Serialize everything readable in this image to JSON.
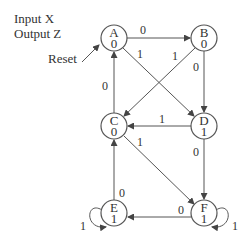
{
  "header": {
    "input": "Input X",
    "output": "Output Z"
  },
  "reset_label": "Reset",
  "states": [
    {
      "name": "A",
      "output": "0",
      "x": 114,
      "y": 38
    },
    {
      "name": "B",
      "output": "0",
      "x": 204,
      "y": 38
    },
    {
      "name": "C",
      "output": "0",
      "x": 114,
      "y": 126
    },
    {
      "name": "D",
      "output": "1",
      "x": 204,
      "y": 126
    },
    {
      "name": "E",
      "output": "1",
      "x": 114,
      "y": 213
    },
    {
      "name": "F",
      "output": "1",
      "x": 204,
      "y": 213
    }
  ],
  "transitions": [
    {
      "from": "A",
      "to": "B",
      "input": "0"
    },
    {
      "from": "A",
      "to": "D",
      "input": "1"
    },
    {
      "from": "B",
      "to": "C",
      "input": "1"
    },
    {
      "from": "B",
      "to": "D",
      "input": "0"
    },
    {
      "from": "C",
      "to": "A",
      "input": "0"
    },
    {
      "from": "C",
      "to": "F",
      "input": "1"
    },
    {
      "from": "D",
      "to": "C",
      "input": "1"
    },
    {
      "from": "D",
      "to": "F",
      "input": "0"
    },
    {
      "from": "E",
      "to": "C",
      "input": "0"
    },
    {
      "from": "E",
      "to": "E",
      "input": "1"
    },
    {
      "from": "F",
      "to": "E",
      "input": "0"
    },
    {
      "from": "F",
      "to": "F",
      "input": "1"
    }
  ]
}
